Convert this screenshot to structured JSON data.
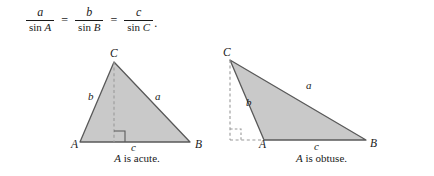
{
  "formula": {
    "description": "Law of Sines",
    "terms": [
      {
        "numerator": "a",
        "denominator_fn": "sin",
        "denominator_var": "A"
      },
      {
        "numerator": "b",
        "denominator_fn": "sin",
        "denominator_var": "B"
      },
      {
        "numerator": "c",
        "denominator_fn": "sin",
        "denominator_var": "C"
      }
    ],
    "equals_1": "=",
    "equals_2": "=",
    "trailing_punctuation": "."
  },
  "colors": {
    "triangle_fill": "#c9c9c9",
    "triangle_stroke": "#595959",
    "dashed_stroke": "#9a9a9a",
    "text": "#1a1a1a",
    "background": "#ffffff"
  },
  "figures": [
    {
      "id": "acute",
      "caption_variable": "A",
      "caption_text": " is acute.",
      "vertices": {
        "A": "A",
        "B": "B",
        "C": "C"
      },
      "sides": {
        "a": "a",
        "b": "b",
        "c": "c"
      },
      "altitude": "dashed altitude from C to AB",
      "right_angle_marker": "solid square at foot of altitude"
    },
    {
      "id": "obtuse",
      "caption_variable": "A",
      "caption_text": " is obtuse.",
      "vertices": {
        "A": "A",
        "B": "B",
        "C": "C"
      },
      "sides": {
        "a": "a",
        "b": "b",
        "c": "c"
      },
      "altitude": "dashed altitude from C to extension of BA",
      "right_angle_marker": "dashed square at foot of altitude outside triangle"
    }
  ]
}
